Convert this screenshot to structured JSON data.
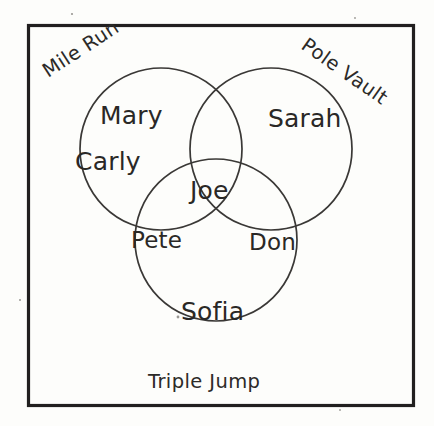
{
  "diagram": {
    "type": "venn",
    "sets": [
      {
        "id": "mile-run",
        "label": "Mile Run",
        "position": "top-left",
        "rotation_deg": -33,
        "center": [
          161,
          149
        ],
        "radius": 81
      },
      {
        "id": "pole-vault",
        "label": "Pole Vault",
        "position": "top-right",
        "rotation_deg": 35,
        "center": [
          271,
          149
        ],
        "radius": 81
      },
      {
        "id": "triple-jump",
        "label": "Triple Jump",
        "position": "bottom",
        "rotation_deg": 0,
        "center": [
          216,
          240
        ],
        "radius": 81
      }
    ],
    "regions": [
      {
        "id": "mile-run-only",
        "sets": [
          "mile-run"
        ],
        "members": [
          "Mary",
          "Carly"
        ]
      },
      {
        "id": "pole-vault-only",
        "sets": [
          "pole-vault"
        ],
        "members": [
          "Sarah"
        ]
      },
      {
        "id": "triple-jump-only",
        "sets": [
          "triple-jump"
        ],
        "members": [
          "Sofia"
        ]
      },
      {
        "id": "mile-run-triple-jump",
        "sets": [
          "mile-run",
          "triple-jump"
        ],
        "members": [
          "Pete"
        ]
      },
      {
        "id": "pole-vault-triple-jump",
        "sets": [
          "pole-vault",
          "triple-jump"
        ],
        "members": [
          "Don"
        ]
      },
      {
        "id": "all-three",
        "sets": [
          "mile-run",
          "pole-vault",
          "triple-jump"
        ],
        "members": [
          "Joe"
        ]
      },
      {
        "id": "mile-run-pole-vault",
        "sets": [
          "mile-run",
          "pole-vault"
        ],
        "members": []
      }
    ],
    "members": {
      "mary": "Mary",
      "carly": "Carly",
      "sarah": "Sarah",
      "joe": "Joe",
      "pete": "Pete",
      "don": "Don",
      "sofia": "Sofia"
    },
    "colors": {
      "background": "#fdfdfb",
      "frame_stroke": "#211f1f",
      "circle_stroke": "#3a3836",
      "text": "#2a2826"
    }
  }
}
